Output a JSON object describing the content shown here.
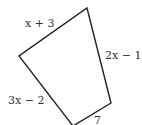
{
  "figure": {
    "type": "quadrilateral",
    "stroke_color": "#222222",
    "side_labels": {
      "top_left": "x + 3",
      "right": "2x − 1",
      "bottom_left": "3x − 2",
      "bottom": "7"
    }
  }
}
